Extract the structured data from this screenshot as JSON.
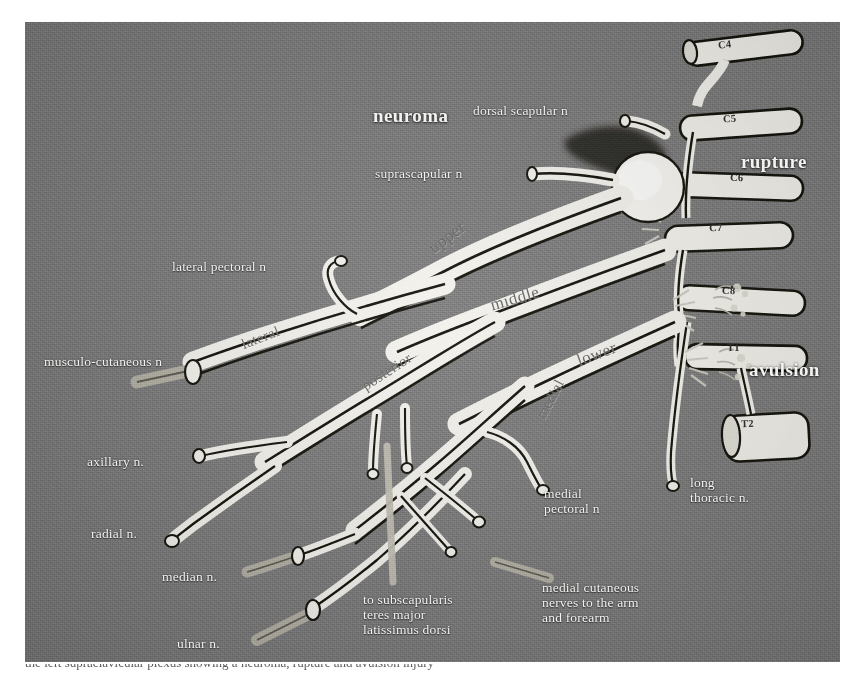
{
  "figure": {
    "kind": "anatomical-diagram",
    "background_color": "#7e7e7e",
    "nerve_color": "#f4f3ee",
    "caption_fragment": "the left supraclavicular plexus showing a neuroma, rupture and avulsion injury"
  },
  "injury_labels": [
    {
      "id": "neuroma",
      "text": "neuroma",
      "x": 348,
      "y": 96,
      "bold": true
    },
    {
      "id": "rupture",
      "text": "rupture",
      "x": 740,
      "y": 140,
      "bold": true
    },
    {
      "id": "avulsion",
      "text": "avulsion",
      "x": 748,
      "y": 348,
      "bold": true
    }
  ],
  "nerve_labels": [
    {
      "id": "dorsal-scapular-n",
      "text": "dorsal scapular n",
      "x": 472,
      "y": 89
    },
    {
      "id": "suprascapular-n",
      "text": "suprascapular n",
      "x": 374,
      "y": 152
    },
    {
      "id": "lateral-pectoral-n",
      "text": "lateral pectoral n",
      "x": 171,
      "y": 245
    },
    {
      "id": "musculo-cutaneous-n",
      "text": "musculo-cutaneous n",
      "x": 43,
      "y": 340
    },
    {
      "id": "axillary-n",
      "text": "axillary n.",
      "x": 86,
      "y": 440
    },
    {
      "id": "radial-n",
      "text": "radial n.",
      "x": 90,
      "y": 512
    },
    {
      "id": "median-n",
      "text": "median n.",
      "x": 161,
      "y": 555
    },
    {
      "id": "ulnar-n",
      "text": "ulnar n.",
      "x": 176,
      "y": 622
    },
    {
      "id": "medial-pectoral-n",
      "text": "medial\npectoral n",
      "x": 543,
      "y": 472
    },
    {
      "id": "long-thoracic-n",
      "text": "long\nthoracic n.",
      "x": 689,
      "y": 461
    },
    {
      "id": "to-subscapularis",
      "text": "to subscapularis\nteres major\nlatissimus dorsi",
      "x": 362,
      "y": 578
    },
    {
      "id": "medial-cutaneous",
      "text": "medial cutaneous\nnerves to the arm\nand forearm",
      "x": 541,
      "y": 566
    }
  ],
  "trunk_labels": [
    {
      "id": "upper",
      "text": "upper",
      "x": 424,
      "y": 232,
      "rot": -37
    },
    {
      "id": "middle",
      "text": "middle",
      "x": 487,
      "y": 284,
      "rot": -16
    },
    {
      "id": "lower",
      "text": "lower",
      "x": 573,
      "y": 340,
      "rot": -20
    }
  ],
  "cord_labels": [
    {
      "id": "lateral",
      "text": "lateral",
      "x": 235,
      "y": 321,
      "rot": -21
    },
    {
      "id": "posterior",
      "text": "posterior",
      "x": 356,
      "y": 365,
      "rot": -33
    },
    {
      "id": "medial",
      "text": "medial",
      "x": 522,
      "y": 404,
      "rot": -62
    }
  ],
  "roots": [
    {
      "id": "C4",
      "text": "C4",
      "x": 718,
      "y": 45
    },
    {
      "id": "C5",
      "text": "C5",
      "x": 723,
      "y": 119
    },
    {
      "id": "C6",
      "text": "C6",
      "x": 730,
      "y": 178
    },
    {
      "id": "C7",
      "text": "C7",
      "x": 709,
      "y": 228
    },
    {
      "id": "C8",
      "text": "C8",
      "x": 722,
      "y": 291
    },
    {
      "id": "T1",
      "text": "T1",
      "x": 727,
      "y": 348
    },
    {
      "id": "T2",
      "text": "T2",
      "x": 741,
      "y": 424
    }
  ]
}
